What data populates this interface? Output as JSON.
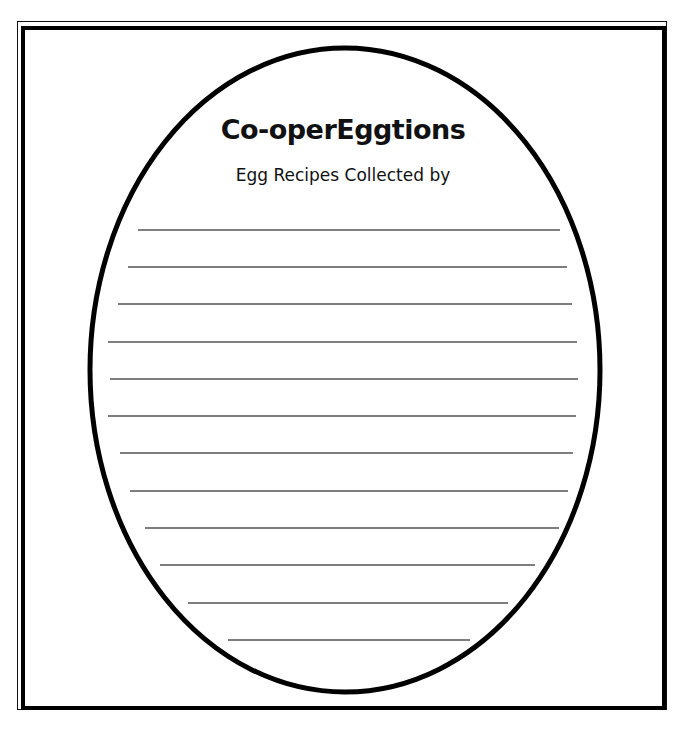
{
  "document": {
    "title": "Co-operEggtions",
    "subtitle": "Egg Recipes Collected by",
    "colors": {
      "ink": "#000000",
      "rule": "#555555",
      "paper": "#ffffff"
    },
    "egg": {
      "cx": 345,
      "cy": 370,
      "rx": 255,
      "ry": 322,
      "stroke_width": 5
    },
    "writing_lines": [
      {
        "y": 230,
        "x1": 138,
        "x2": 560
      },
      {
        "y": 267,
        "x1": 128,
        "x2": 567
      },
      {
        "y": 304,
        "x1": 118,
        "x2": 572
      },
      {
        "y": 342,
        "x1": 108,
        "x2": 577
      },
      {
        "y": 379,
        "x1": 110,
        "x2": 578
      },
      {
        "y": 416,
        "x1": 108,
        "x2": 576
      },
      {
        "y": 453,
        "x1": 120,
        "x2": 573
      },
      {
        "y": 491,
        "x1": 130,
        "x2": 568
      },
      {
        "y": 528,
        "x1": 145,
        "x2": 559
      },
      {
        "y": 565,
        "x1": 160,
        "x2": 535
      },
      {
        "y": 603,
        "x1": 188,
        "x2": 508
      },
      {
        "y": 640,
        "x1": 228,
        "x2": 470
      }
    ]
  }
}
